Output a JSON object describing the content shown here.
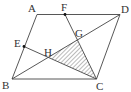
{
  "figure": {
    "type": "geometry",
    "colors": {
      "stroke": "#444444",
      "hatch": "#555555",
      "point": "#111111",
      "background": "#ffffff"
    },
    "points": {
      "A": {
        "label": "A",
        "x": 37,
        "y": 14.5
      },
      "B": {
        "label": "B",
        "x": 12,
        "y": 79
      },
      "C": {
        "label": "C",
        "x": 96.5,
        "y": 79
      },
      "D": {
        "label": "D",
        "x": 120,
        "y": 14.5
      },
      "E": {
        "label": "E",
        "x": 24,
        "y": 46.5
      },
      "F": {
        "label": "F",
        "x": 65,
        "y": 14.5
      },
      "G": {
        "label": "G",
        "x": 77,
        "y": 40
      },
      "H": {
        "label": "H",
        "x": 48,
        "y": 57
      }
    },
    "segments": [
      "AB",
      "BC",
      "CD",
      "DA",
      "BD",
      "EC",
      "FC"
    ],
    "shaded_region": [
      "H",
      "G",
      "C"
    ]
  }
}
